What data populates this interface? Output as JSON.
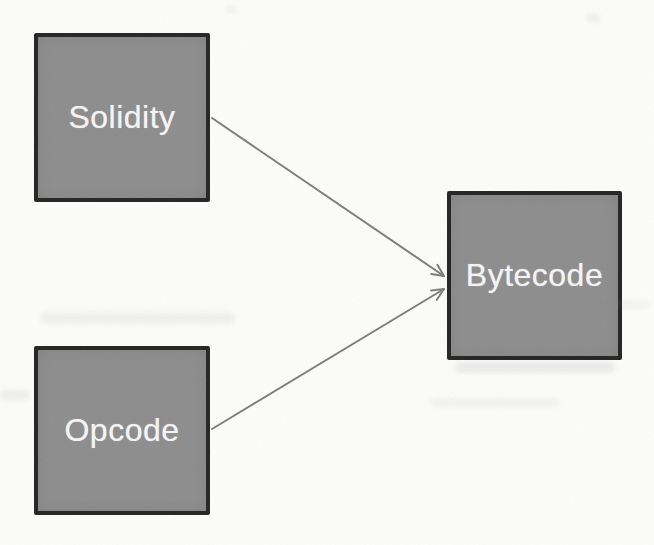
{
  "figure": {
    "kind": "flow-diagram",
    "background_color": "#fcfcfb"
  },
  "diagram": {
    "nodes": [
      {
        "id": "solidity",
        "label": "Solidity"
      },
      {
        "id": "opcode",
        "label": "Opcode"
      },
      {
        "id": "bytecode",
        "label": "Bytecode"
      }
    ],
    "edges": [
      {
        "from": "solidity",
        "to": "bytecode",
        "arrow": "end"
      },
      {
        "from": "opcode",
        "to": "bytecode",
        "arrow": "end"
      }
    ],
    "style": {
      "node_fill": "#8d8d8d",
      "node_border": "#242424",
      "node_text_color": "#f5f5f5",
      "edge_color": "#7d7d7d"
    }
  }
}
